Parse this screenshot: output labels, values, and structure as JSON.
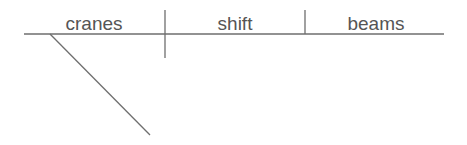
{
  "diagram": {
    "type": "sentence-diagram",
    "subject": "cranes",
    "verb": "shift",
    "direct_object": "beams",
    "colors": {
      "line": "#6e6e6e",
      "text": "#555555",
      "background": "#ffffff"
    }
  }
}
